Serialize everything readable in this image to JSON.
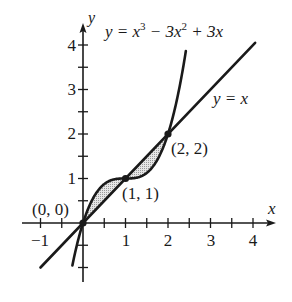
{
  "figure": {
    "type": "function-graph",
    "x_axis": {
      "label": "x",
      "ticks": [
        -1,
        -0.5,
        0.5,
        1,
        1.5,
        2,
        2.5,
        3,
        3.5,
        4
      ],
      "tick_labels": [
        "−1",
        "1",
        "2",
        "3",
        "4"
      ],
      "range": [
        -1.05,
        4.5
      ]
    },
    "y_axis": {
      "label": "y",
      "ticks": [
        -1,
        -0.5,
        0.5,
        1,
        1.5,
        2,
        2.5,
        3,
        3.5,
        4
      ],
      "tick_labels": [
        "1",
        "2",
        "3",
        "4"
      ],
      "range": [
        -1.3,
        4.45
      ]
    },
    "curves": [
      {
        "name": "cubic",
        "equation": "y = x^3 - 3x^2 + 3x",
        "label_parts": [
          "y = x",
          "3",
          " − 3x",
          "2",
          " + 3x"
        ],
        "x_range": [
          -0.25,
          2.42
        ]
      },
      {
        "name": "line",
        "equation": "y = x",
        "label": "y = x",
        "x_range": [
          -1,
          4.05
        ]
      }
    ],
    "intersection_points": [
      {
        "label": "(0, 0)",
        "x": 0,
        "y": 0
      },
      {
        "label": "(1, 1)",
        "x": 1,
        "y": 1
      },
      {
        "label": "(2, 2)",
        "x": 2,
        "y": 2
      }
    ],
    "shaded_regions": [
      {
        "between": [
          "cubic",
          "line"
        ],
        "x_from": 0,
        "x_to": 1
      },
      {
        "between": [
          "line",
          "cubic"
        ],
        "x_from": 1,
        "x_to": 2
      }
    ],
    "colors": {
      "ink": "#1a1a1a",
      "shade": "#d0d0d0"
    }
  }
}
